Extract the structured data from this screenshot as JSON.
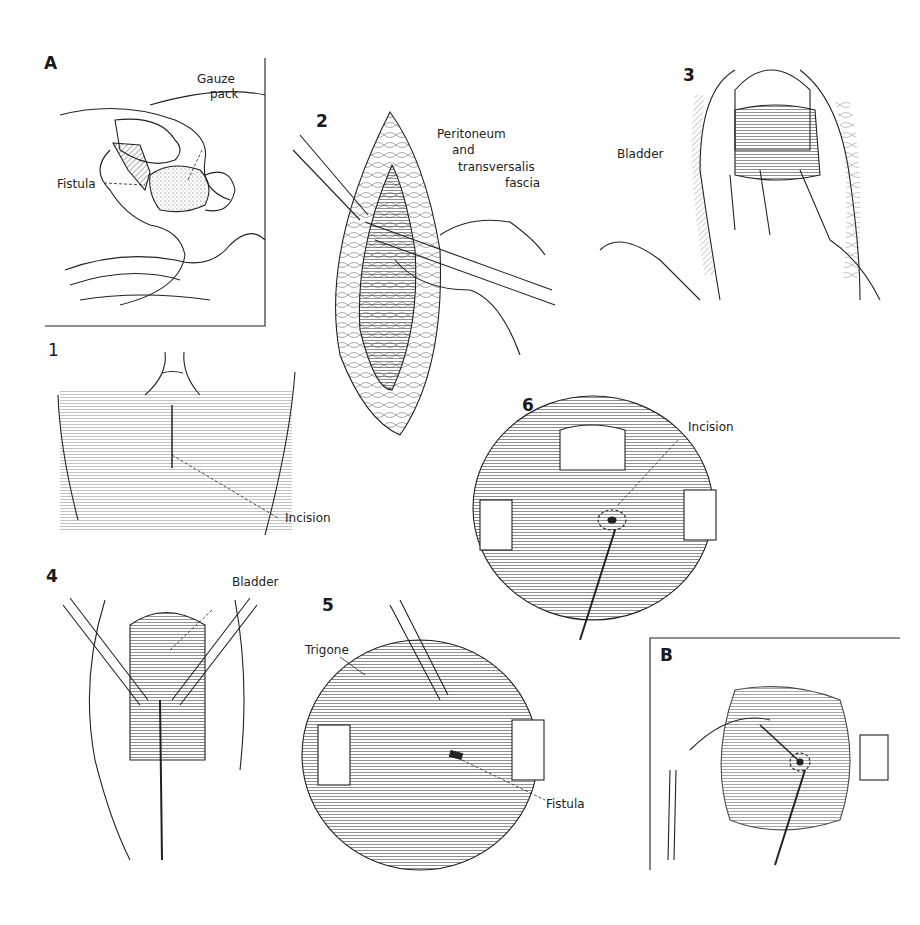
{
  "figure": {
    "panels": [
      {
        "id": "A",
        "label": "A",
        "annotations": [
          "Gauze pack",
          "Fistula"
        ]
      },
      {
        "id": "1",
        "label": "1",
        "annotations": [
          "Incision"
        ]
      },
      {
        "id": "2",
        "label": "2",
        "annotations": [
          "Peritoneum and transversalis fascia"
        ]
      },
      {
        "id": "3",
        "label": "3",
        "annotations": [
          "Bladder"
        ]
      },
      {
        "id": "4",
        "label": "4",
        "annotations": [
          "Bladder"
        ]
      },
      {
        "id": "5",
        "label": "5",
        "annotations": [
          "Trigone",
          "Fistula"
        ]
      },
      {
        "id": "6",
        "label": "6",
        "annotations": [
          "Incision"
        ]
      },
      {
        "id": "B",
        "label": "B",
        "annotations": []
      }
    ]
  },
  "labels": {
    "A": {
      "panel": "A",
      "gauze_1": "Gauze",
      "gauze_2": "pack",
      "fistula": "Fistula"
    },
    "p1": {
      "panel": "1",
      "incision": "Incision"
    },
    "p2": {
      "panel": "2",
      "line1": "Peritoneum",
      "line2": "and",
      "line3": "transversalis",
      "line4": "fascia"
    },
    "p3": {
      "panel": "3",
      "bladder": "Bladder"
    },
    "p4": {
      "panel": "4",
      "bladder": "Bladder"
    },
    "p5": {
      "panel": "5",
      "trigone": "Trigone",
      "fistula": "Fistula"
    },
    "p6": {
      "panel": "6",
      "incision": "Incision"
    },
    "B": {
      "panel": "B"
    }
  },
  "colors": {
    "ink": "#1a1a1a",
    "paper": "#ffffff",
    "hatch": "#555555"
  }
}
